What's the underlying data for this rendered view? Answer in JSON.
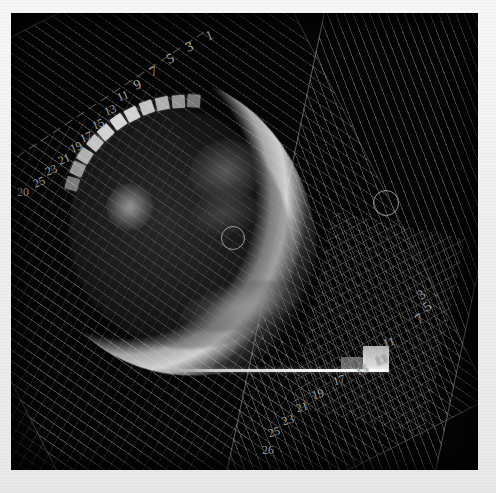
{
  "view": {
    "title": "radiotherapy-dose-plan-view",
    "background_color": "#050505",
    "frame_color": "#f2f2f2",
    "width": 496,
    "height": 493
  },
  "fields": [
    {
      "id": "field-a",
      "name": "primary-beam-field",
      "style": "hatched",
      "hatch_color": "#969696",
      "rotation_deg": -27
    },
    {
      "id": "field-b",
      "name": "secondary-beam-field",
      "style": "hatched",
      "hatch_color": "#a0a0a0",
      "rotation_deg": 12
    }
  ],
  "markers": {
    "isocenter_center": {
      "label": "isocenter",
      "x": 232,
      "y": 237,
      "radius": 11
    },
    "isocenter_right": {
      "label": "isocenter",
      "x": 385,
      "y": 202,
      "radius": 12
    }
  },
  "leaf_labels_top": [
    {
      "text": "1",
      "x": 206,
      "y": 29,
      "rot": -22
    },
    {
      "text": "3",
      "x": 186,
      "y": 40,
      "rot": -22
    },
    {
      "text": "5",
      "x": 167,
      "y": 52,
      "rot": -22
    },
    {
      "text": "7",
      "x": 150,
      "y": 65,
      "rot": -22
    },
    {
      "text": "9",
      "x": 134,
      "y": 78,
      "rot": -22
    },
    {
      "text": "11",
      "x": 117,
      "y": 90,
      "rot": -22
    },
    {
      "text": "13",
      "x": 104,
      "y": 104,
      "rot": -22
    },
    {
      "text": "15",
      "x": 92,
      "y": 118,
      "rot": -22
    },
    {
      "text": "17",
      "x": 80,
      "y": 131,
      "rot": -22
    },
    {
      "text": "19",
      "x": 70,
      "y": 141,
      "rot": -22
    },
    {
      "text": "21",
      "x": 58,
      "y": 153,
      "rot": -22
    },
    {
      "text": "23",
      "x": 45,
      "y": 164,
      "rot": -22
    },
    {
      "text": "25",
      "x": 33,
      "y": 176,
      "rot": -22
    },
    {
      "text": "20",
      "x": 17,
      "y": 186,
      "rot": 0
    }
  ],
  "leaf_labels_bottom": [
    {
      "text": "11",
      "x": 383,
      "y": 336,
      "rot": -16
    },
    {
      "text": "13",
      "x": 375,
      "y": 354,
      "rot": -16
    },
    {
      "text": "15",
      "x": 356,
      "y": 364,
      "rot": -16
    },
    {
      "text": "17",
      "x": 333,
      "y": 374,
      "rot": -16
    },
    {
      "text": "19",
      "x": 312,
      "y": 388,
      "rot": -16
    },
    {
      "text": "21",
      "x": 296,
      "y": 401,
      "rot": -16
    },
    {
      "text": "23",
      "x": 282,
      "y": 414,
      "rot": -16
    },
    {
      "text": "25",
      "x": 268,
      "y": 426,
      "rot": -16
    },
    {
      "text": "26",
      "x": 262,
      "y": 444,
      "rot": 0
    }
  ],
  "leaf_labels_right_edge": [
    {
      "text": "3",
      "x": 418,
      "y": 288,
      "rot": -38
    },
    {
      "text": "5",
      "x": 424,
      "y": 300,
      "rot": -38
    },
    {
      "text": "7",
      "x": 416,
      "y": 312,
      "rot": -38
    }
  ],
  "anatomy": {
    "name": "head-cross-section",
    "structures": [
      "skull-rim",
      "soft-tissue",
      "lesion-left",
      "lesion-upper",
      "lesion-mid",
      "spine"
    ],
    "bone_block_count": 11
  },
  "couch": {
    "name": "treatment-couch",
    "visible": true
  }
}
